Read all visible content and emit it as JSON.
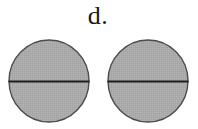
{
  "figure": {
    "label": "d.",
    "background_color": "#ffffff",
    "width": 198,
    "height": 129,
    "shape_count": 2,
    "shapes": [
      {
        "name": "left-circle",
        "kind": "circle",
        "fill_color": "#a9a9a9",
        "stroke_color": "#4d4d4d",
        "center_x": 49,
        "center_y": 81,
        "radius_x": 41,
        "radius_y": 42,
        "divider": {
          "name": "horizontal-diameter",
          "orientation": "horizontal",
          "color": "#1a1a1a",
          "y": 81,
          "fraction_from_top": 0.5
        }
      },
      {
        "name": "right-circle",
        "kind": "circle",
        "fill_color": "#a9a9a9",
        "stroke_color": "#4d4d4d",
        "center_x": 148,
        "center_y": 81,
        "radius_x": 41,
        "radius_y": 42,
        "divider": {
          "name": "horizontal-diameter",
          "orientation": "horizontal",
          "color": "#1a1a1a",
          "y": 81,
          "fraction_from_top": 0.5
        }
      }
    ]
  }
}
